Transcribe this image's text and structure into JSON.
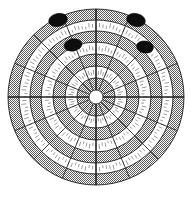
{
  "figure": {
    "background_color": "#ffffff",
    "ink_color": "#1a1a1a",
    "gray_fill_color": "#9a9a9a",
    "marker_color": "#0d0d0d"
  },
  "geometry": {
    "center_x": 96,
    "center_y": 97,
    "outer_radius": 88,
    "hub_radius": 7,
    "sector_count": 16,
    "ring_count": 7
  },
  "chart_data": {
    "type": "scatter",
    "xlabel": "",
    "ylabel": "",
    "coordinate_system": "polar",
    "grid": true,
    "legend": "none",
    "rings": [
      {
        "index": 1,
        "inner_radius": 7,
        "outer_radius": 19,
        "shade": "gray"
      },
      {
        "index": 2,
        "inner_radius": 19,
        "outer_radius": 31,
        "shade": "white"
      },
      {
        "index": 3,
        "inner_radius": 31,
        "outer_radius": 43,
        "shade": "gray"
      },
      {
        "index": 4,
        "inner_radius": 43,
        "outer_radius": 55,
        "shade": "white"
      },
      {
        "index": 5,
        "inner_radius": 55,
        "outer_radius": 66,
        "shade": "gray"
      },
      {
        "index": 6,
        "inner_radius": 66,
        "outer_radius": 77,
        "shade": "white"
      },
      {
        "index": 7,
        "inner_radius": 77,
        "outer_radius": 88,
        "shade": "gray"
      }
    ],
    "spoke_angles_deg": [
      0,
      22.5,
      45,
      67.5,
      90,
      112.5,
      135,
      157.5,
      180,
      202.5,
      225,
      247.5,
      270,
      292.5,
      315,
      337.5
    ],
    "axes_angles_deg": [
      0,
      90,
      180,
      270
    ],
    "markers": [
      {
        "name": "marker-top-left",
        "cx": 58,
        "cy": 20,
        "rx": 9.5,
        "ry": 6.5,
        "rotation_deg": -12
      },
      {
        "name": "marker-top-right",
        "cx": 136,
        "cy": 20,
        "rx": 9.5,
        "ry": 6.5,
        "rotation_deg": 12
      },
      {
        "name": "marker-inner-left",
        "cx": 73,
        "cy": 45,
        "rx": 9.0,
        "ry": 6.0,
        "rotation_deg": -10
      },
      {
        "name": "marker-inner-right",
        "cx": 145,
        "cy": 47,
        "rx": 8.5,
        "ry": 6.0,
        "rotation_deg": 10
      }
    ],
    "marker_count": 4,
    "tick_bands": [
      {
        "ring_index": 2,
        "radius": 25,
        "tick_count": 64
      },
      {
        "ring_index": 4,
        "radius": 49,
        "tick_count": 96
      },
      {
        "ring_index": 6,
        "radius": 71,
        "tick_count": 128
      }
    ]
  }
}
